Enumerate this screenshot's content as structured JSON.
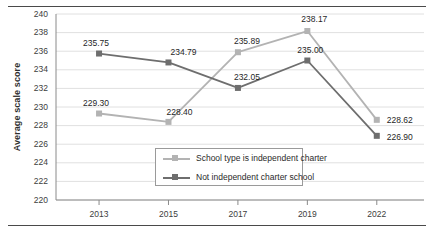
{
  "chart_data": {
    "type": "line",
    "title": "",
    "xlabel": "",
    "ylabel": "Average scale score",
    "categories": [
      "2013",
      "2015",
      "2017",
      "2019",
      "2022"
    ],
    "ylim": [
      220,
      240
    ],
    "yticks": [
      220,
      222,
      224,
      226,
      228,
      230,
      232,
      234,
      236,
      238,
      240
    ],
    "grid": true,
    "legend_position": "inside-bottom-center",
    "series": [
      {
        "name": "School type is independent charter",
        "color": "#b3b3b3",
        "marker": "square",
        "values": [
          229.3,
          228.4,
          235.89,
          238.17,
          228.62
        ],
        "labels": [
          "229.30",
          "228.40",
          "235.89",
          "238.17",
          "228.62"
        ]
      },
      {
        "name": "Not independent charter school",
        "color": "#6e6e6e",
        "marker": "square",
        "values": [
          235.75,
          234.79,
          232.05,
          235.0,
          226.9
        ],
        "labels": [
          "235.75",
          "234.79",
          "232.05",
          "235.00",
          "226.90"
        ]
      }
    ]
  },
  "axis": {
    "yticks": [
      "240",
      "238",
      "236",
      "234",
      "232",
      "230",
      "228",
      "226",
      "224",
      "222",
      "220"
    ],
    "xticks": [
      "2013",
      "2015",
      "2017",
      "2019",
      "2022"
    ],
    "ylabel": "Average scale score"
  },
  "legend": {
    "items": [
      {
        "label": "School type is independent charter"
      },
      {
        "label": "Not independent charter school"
      }
    ]
  },
  "data_labels": {
    "light": [
      "229.30",
      "228.40",
      "235.89",
      "238.17",
      "228.62"
    ],
    "dark": [
      "235.75",
      "234.79",
      "232.05",
      "235.00",
      "226.90"
    ]
  },
  "colors": {
    "series_light": "#b3b3b3",
    "series_dark": "#6e6e6e",
    "grid": "#e0e0e0",
    "axis": "#8a8a8a",
    "rule": "#4a4a4a"
  }
}
